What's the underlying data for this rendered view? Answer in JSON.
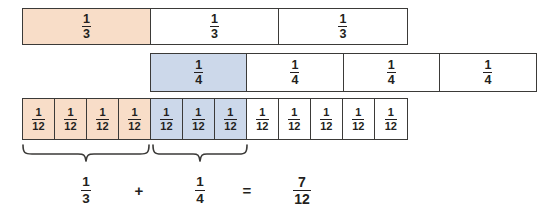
{
  "diagram": {
    "colors": {
      "peach_fill": "#f8ddc8",
      "blue_fill": "#ccd8ea",
      "white_fill": "#ffffff",
      "border": "#3b3a38",
      "text": "#231f20"
    },
    "rows": [
      {
        "name": "thirds",
        "denominator": "3",
        "cells": [
          {
            "numerator": "1",
            "denominator": "3",
            "fill": "peach"
          },
          {
            "numerator": "1",
            "denominator": "3",
            "fill": "white"
          },
          {
            "numerator": "1",
            "denominator": "3",
            "fill": "white"
          }
        ]
      },
      {
        "name": "fourths",
        "denominator": "4",
        "cells": [
          {
            "numerator": "1",
            "denominator": "4",
            "fill": "blue"
          },
          {
            "numerator": "1",
            "denominator": "4",
            "fill": "white"
          },
          {
            "numerator": "1",
            "denominator": "4",
            "fill": "white"
          },
          {
            "numerator": "1",
            "denominator": "4",
            "fill": "white"
          }
        ]
      },
      {
        "name": "twelfths",
        "denominator": "12",
        "cells": [
          {
            "numerator": "1",
            "denominator": "12",
            "fill": "peach"
          },
          {
            "numerator": "1",
            "denominator": "12",
            "fill": "peach"
          },
          {
            "numerator": "1",
            "denominator": "12",
            "fill": "peach"
          },
          {
            "numerator": "1",
            "denominator": "12",
            "fill": "peach"
          },
          {
            "numerator": "1",
            "denominator": "12",
            "fill": "blue"
          },
          {
            "numerator": "1",
            "denominator": "12",
            "fill": "blue"
          },
          {
            "numerator": "1",
            "denominator": "12",
            "fill": "blue"
          },
          {
            "numerator": "1",
            "denominator": "12",
            "fill": "white"
          },
          {
            "numerator": "1",
            "denominator": "12",
            "fill": "white"
          },
          {
            "numerator": "1",
            "denominator": "12",
            "fill": "white"
          },
          {
            "numerator": "1",
            "denominator": "12",
            "fill": "white"
          },
          {
            "numerator": "1",
            "denominator": "12",
            "fill": "white"
          }
        ]
      }
    ],
    "braces": [
      {
        "name": "brace-thirds",
        "spans": "four twelfths"
      },
      {
        "name": "brace-fourths",
        "spans": "three twelfths"
      }
    ],
    "equation": {
      "left": {
        "numerator": "1",
        "denominator": "3"
      },
      "operator": "+",
      "right": {
        "numerator": "1",
        "denominator": "4"
      },
      "equals": "=",
      "result": {
        "numerator": "7",
        "denominator": "12"
      }
    }
  }
}
